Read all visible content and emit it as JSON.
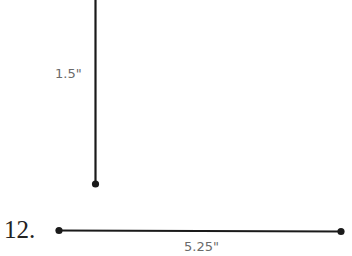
{
  "problem": {
    "number": "12.",
    "segments": [
      {
        "orientation": "vertical",
        "length_label": "1.5\""
      },
      {
        "orientation": "horizontal",
        "length_label": "5.25\""
      }
    ]
  }
}
